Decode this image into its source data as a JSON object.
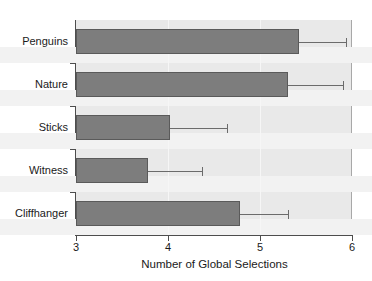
{
  "chart_data": {
    "type": "bar",
    "orientation": "horizontal",
    "title": "",
    "xlabel": "Number of Global Selections",
    "ylabel": "",
    "categories": [
      "Penguins",
      "Nature",
      "Sticks",
      "Witness",
      "Cliffhanger"
    ],
    "values": [
      5.42,
      5.3,
      4.02,
      3.78,
      4.78
    ],
    "error_upper": [
      5.94,
      5.9,
      4.64,
      4.37,
      5.3
    ],
    "xlim": [
      3,
      6
    ],
    "xticks": [
      3,
      4,
      5,
      6
    ],
    "xtick_labels": [
      "3",
      "4",
      "5",
      "6"
    ],
    "grid": true,
    "legend": false,
    "colors": {
      "bar_fill": "#7d7d7d",
      "bar_border": "#5a5a5a",
      "panel_background": "#e9e9e9",
      "band": "#f2f2f2",
      "axis": "#4d4d4d",
      "error_bar": "#6b6b6b",
      "text": "#1a1a1a"
    }
  }
}
